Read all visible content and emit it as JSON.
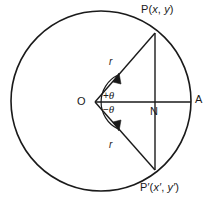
{
  "figure": {
    "type": "geometry-diagram",
    "stroke_color": "#1a1a1a",
    "background_color": "#ffffff",
    "labels": {
      "point_P": "P(x, y)",
      "point_P_prefix": "P(",
      "point_P_x": "x",
      "point_P_comma": ", ",
      "point_P_y": "y",
      "point_P_suffix": ")",
      "point_P_prime": "P′(x′, y′)",
      "point_P_prime_prefix": "P′(",
      "point_P_prime_x": "x′",
      "point_P_prime_comma": ", ",
      "point_P_prime_y": "y′",
      "point_P_prime_suffix": ")",
      "origin": "O",
      "foot_of_perpendicular": "N",
      "axis_point": "A",
      "radius_upper": "r",
      "radius_lower": "r",
      "angle_positive_sign": "+",
      "angle_positive_symbol": "θ",
      "angle_negative_sign": "−",
      "angle_negative_symbol": "θ"
    },
    "geometry": {
      "circle": {
        "cx": 101,
        "cy": 101,
        "r": 90
      },
      "vertex_O": {
        "x": 95,
        "y": 102
      },
      "point_P": {
        "x": 155,
        "y": 33
      },
      "point_P_prime": {
        "x": 155,
        "y": 170
      },
      "point_N": {
        "x": 155,
        "y": 102
      },
      "point_A": {
        "x": 191,
        "y": 102
      }
    }
  }
}
